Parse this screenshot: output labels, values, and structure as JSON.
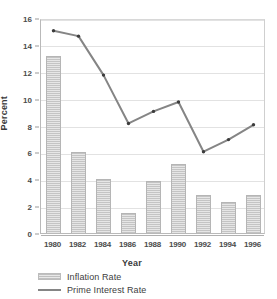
{
  "chart_data": {
    "type": "bar",
    "title": "",
    "subtitle": "",
    "xlabel": "Year",
    "ylabel": "Percent",
    "categories": [
      "1980",
      "1982",
      "1984",
      "1986",
      "1988",
      "1990",
      "1992",
      "1994",
      "1996"
    ],
    "ylim": [
      0,
      16
    ],
    "y_ticks": [
      0,
      2,
      4,
      6,
      8,
      10,
      12,
      14,
      16
    ],
    "y_tick_labels": [
      "0",
      "2",
      "4",
      "6",
      "8",
      "10",
      "12",
      "14",
      "16"
    ],
    "grid": true,
    "legend_position": "below",
    "series": [
      {
        "name": "Inflation Rate",
        "type": "bar",
        "color": "#d2d2d2",
        "values": [
          13.2,
          6.0,
          4.0,
          1.5,
          3.9,
          5.1,
          2.8,
          2.3,
          2.8
        ]
      },
      {
        "name": "Prime Interest Rate",
        "type": "line",
        "color": "#858585",
        "values": [
          15.2,
          14.8,
          11.9,
          8.3,
          9.2,
          9.9,
          6.2,
          7.1,
          8.2
        ]
      }
    ]
  },
  "legend": {
    "items": [
      {
        "label": "Inflation Rate",
        "marker": "hatched-bar-swatch"
      },
      {
        "label": "Prime Interest Rate",
        "marker": "line-swatch"
      }
    ]
  },
  "colors": {
    "bar_fill": "#d2d2d2",
    "bar_stroke": "#b5b5b5",
    "line": "#858585",
    "marker": "#3c3c3c",
    "gridline": "#e2e2e2",
    "axis": "#b0b0b0",
    "text": "#3a3a3a",
    "background": "#ffffff"
  }
}
